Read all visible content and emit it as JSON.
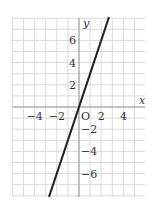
{
  "chart_data": {
    "type": "line",
    "title": "",
    "xlabel": "x",
    "ylabel": "y",
    "origin_label": "O",
    "xlim": [
      -6,
      6
    ],
    "ylim": [
      -8,
      8
    ],
    "grid": true,
    "grid_step": 1,
    "x_ticks": [
      -4,
      -2,
      2,
      4
    ],
    "x_tick_labels": [
      "−4",
      "−2",
      "2",
      "4"
    ],
    "y_ticks": [
      6,
      4,
      2,
      -2,
      -4,
      -6
    ],
    "y_tick_labels": [
      "6",
      "4",
      "2",
      "−2",
      "−4",
      "−6"
    ],
    "series": [
      {
        "name": "y = 3x",
        "equation": "y = 3x",
        "slope": 3,
        "intercept": 0,
        "x": [
          -2.7,
          0,
          2.7
        ],
        "y": [
          -8.1,
          0,
          8.1
        ],
        "color": "#222222"
      }
    ],
    "legend": null
  },
  "colors": {
    "grid": "#d9d9d9",
    "axis": "#999999",
    "line": "#222222",
    "text": "#333333"
  }
}
